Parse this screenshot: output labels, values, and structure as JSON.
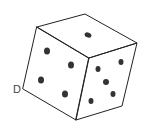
{
  "drawing": {
    "subject": "die sketch",
    "corner_label": "D",
    "stroke_color": "#222222",
    "pip_color": "#333333",
    "top_face": {
      "pips": 1
    },
    "left_face": {
      "pips": 4
    },
    "right_face": {
      "pips": 5
    }
  }
}
